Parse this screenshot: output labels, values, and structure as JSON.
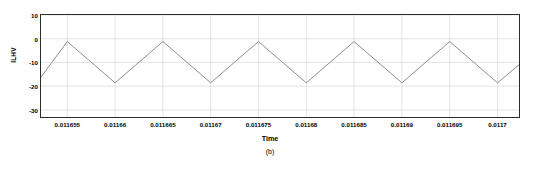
{
  "figure": {
    "caption": "(b)",
    "background_color": "#ffffff",
    "axis_color": "#2b2b2b",
    "grid_color": "#d9d9d9",
    "line_color": "#808080"
  },
  "chart_data": {
    "type": "line",
    "title": "",
    "subtitle": "",
    "xlabel": "Time",
    "ylabel": "ILHV",
    "annotation": "(b)",
    "grid": true,
    "legend": [],
    "legend_position": "none",
    "xlim": [
      0.01165225,
      0.01170225
    ],
    "ylim": [
      -33.0,
      10.0
    ],
    "xticks": [
      0.011655,
      0.01166,
      0.011665,
      0.01167,
      0.011675,
      0.01168,
      0.011685,
      0.01169,
      0.011695,
      0.0117
    ],
    "xtick_labels": [
      "0.011655",
      "0.01166",
      "0.011665",
      "0.01167",
      "0.011675",
      "0.01168",
      "0.011685",
      "0.01169",
      "0.011695",
      "0.0117"
    ],
    "yticks": [
      10,
      0,
      -10,
      -20,
      -30
    ],
    "ytick_labels": [
      "10",
      "0",
      "-10",
      "-20",
      "-30"
    ],
    "series": [
      {
        "name": "ILHV",
        "color": "#808080",
        "waveform": "triangular",
        "peak_value": -1.2,
        "trough_value": -18.6,
        "x": [
          0.01165225,
          0.011655,
          0.0116575,
          0.01166,
          0.0116625,
          0.011665,
          0.0116675,
          0.01167,
          0.0116725,
          0.011675,
          0.0116775,
          0.01168,
          0.0116825,
          0.011685,
          0.0116875,
          0.01169,
          0.0116925,
          0.011695,
          0.0116975,
          0.0117,
          0.01170225
        ],
        "y": [
          -16.2,
          -1.2,
          -9.9,
          -18.6,
          -9.9,
          -1.2,
          -9.9,
          -18.6,
          -9.9,
          -1.2,
          -9.9,
          -18.6,
          -9.9,
          -1.2,
          -9.9,
          -18.6,
          -9.9,
          -1.2,
          -9.9,
          -18.6,
          -11.0
        ]
      }
    ]
  }
}
